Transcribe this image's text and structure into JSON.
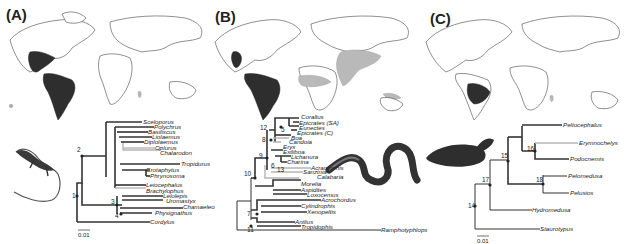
{
  "panels": [
    {
      "label": "(A)",
      "group": "Pleurodont iguanian lizards",
      "map_note": "Dark range: Americas (North, Central, South America); light patch: Madagascar; grey dot: Galapagos/Pacific",
      "taxa": [
        "Sceloporus",
        "Polychrus",
        "Basiliscus",
        "Liolaemus",
        "Diplolaemus",
        "Oplurus",
        "Chalarodon",
        "Tropidurus",
        "Crotaphytus",
        "Phrynosoma",
        "Leiocephalus",
        "Brachylophus",
        "Leiolepis",
        "Uromastyx",
        "Chamaeleo",
        "Physignathus",
        "Cordylus"
      ],
      "grey_taxa": [
        "Oplurus",
        "Chalarodon",
        "Brachylophus"
      ],
      "nodes": [
        "1",
        "2",
        "3",
        "4"
      ],
      "scale_bar": "0.01"
    },
    {
      "label": "(B)",
      "group": "Boid snakes",
      "map_note": "Dark range: Central and South America; light range: Africa, Middle East, Central Asia, New Guinea",
      "taxa": [
        "Corallus",
        "Epicrates (SA)",
        "Eunectes",
        "Epicrates (C)",
        "Boa",
        "Candoia",
        "Eryx",
        "Exiliboa",
        "Lichanura",
        "Charina",
        "Acrantophis",
        "Sanzinia",
        "Calabaria",
        "Morelia",
        "Aspidites",
        "Loxocemus",
        "Acrochordus",
        "Cylindrophis",
        "Xenopeltis",
        "Anilius",
        "Tropidophis",
        "Ramphotyphlops"
      ],
      "grey_taxa": [
        "Candoia",
        "Eryx",
        "Acrantophis",
        "Sanzinia",
        "Calabaria"
      ],
      "nodes": [
        "5",
        "6",
        "7",
        "8",
        "9",
        "10",
        "11",
        "12",
        "13"
      ],
      "scale_bar": ""
    },
    {
      "label": "(C)",
      "group": "Podocnemidid turtles",
      "map_note": "Dark range: northern South America (Amazon basin); light patch: Madagascar",
      "taxa": [
        "Peltocephalus",
        "Erymnochelys",
        "Podocnemis",
        "Pelomedusa",
        "Pelusios",
        "Hydromedusa",
        "Staurotypus"
      ],
      "grey_taxa": [
        "Erymnochelys"
      ],
      "nodes": [
        "14",
        "15",
        "16",
        "17",
        "18"
      ],
      "scale_bar": "0.01"
    }
  ]
}
